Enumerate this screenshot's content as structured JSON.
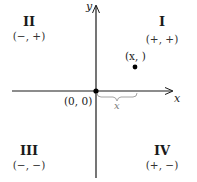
{
  "diagram": {
    "axes": {
      "x_label": "x",
      "y_label": "y",
      "color": "#1a1a1a"
    },
    "origin": {
      "label": "(0, 0)"
    },
    "point": {
      "label": "(x,  )"
    },
    "brace": {
      "label": "x",
      "color": "#9a9a9a"
    },
    "quadrants": [
      {
        "id": "I",
        "numeral": "I",
        "signs": "(+, +)"
      },
      {
        "id": "II",
        "numeral": "II",
        "signs": "(−, +)"
      },
      {
        "id": "III",
        "numeral": "III",
        "signs": "(−, −)"
      },
      {
        "id": "IV",
        "numeral": "IV",
        "signs": "(+, −)"
      }
    ]
  }
}
